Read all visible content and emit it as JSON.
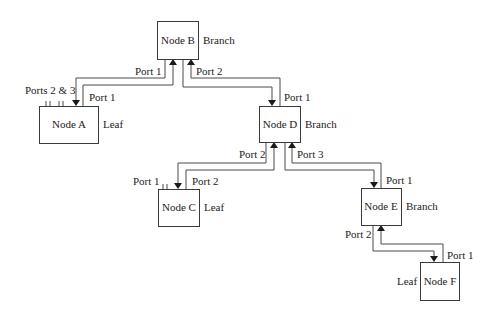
{
  "diagram": {
    "type": "network-topology",
    "nodes": [
      {
        "id": "A",
        "label": "Node A",
        "role": "Leaf"
      },
      {
        "id": "B",
        "label": "Node B",
        "role": "Branch"
      },
      {
        "id": "C",
        "label": "Node C",
        "role": "Leaf"
      },
      {
        "id": "D",
        "label": "Node D",
        "role": "Branch"
      },
      {
        "id": "E",
        "label": "Node E",
        "role": "Branch"
      },
      {
        "id": "F",
        "label": "Node F",
        "role": "Leaf"
      }
    ],
    "port_labels": {
      "b_port1": "Port 1",
      "b_port2": "Port 2",
      "a_port1": "Port 1",
      "a_ports23": "Ports 2 & 3",
      "d_port1": "Port 1",
      "d_port2": "Port 2",
      "d_port3": "Port 3",
      "c_port1": "Port 1",
      "c_port2": "Port 2",
      "e_port1": "Port 1",
      "e_port2": "Port 2",
      "f_port1": "Port 1"
    },
    "links": [
      {
        "from": "B",
        "from_port": "Port 1",
        "to": "A",
        "to_port": "Port 1"
      },
      {
        "from": "B",
        "from_port": "Port 2",
        "to": "D",
        "to_port": "Port 1"
      },
      {
        "from": "D",
        "from_port": "Port 2",
        "to": "C",
        "to_port": "Port 2"
      },
      {
        "from": "D",
        "from_port": "Port 3",
        "to": "E",
        "to_port": "Port 1"
      },
      {
        "from": "E",
        "from_port": "Port 2",
        "to": "F",
        "to_port": "Port 1"
      }
    ]
  }
}
